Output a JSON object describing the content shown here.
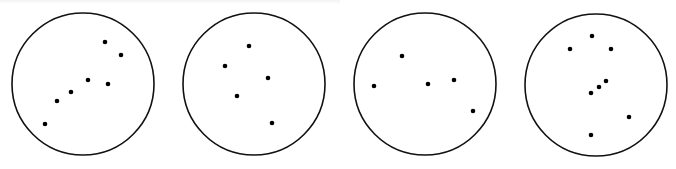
{
  "diagram": {
    "type": "dot-pattern-panels",
    "stroke_color": "#111111",
    "dot_color": "#000000",
    "panels": [
      {
        "id": "panel-1",
        "circle": {
          "cx": 83,
          "cy": 84,
          "r": 71
        },
        "dots": [
          [
            105,
            42
          ],
          [
            121,
            55
          ],
          [
            88,
            80
          ],
          [
            108,
            84
          ],
          [
            71,
            92
          ],
          [
            57,
            101
          ],
          [
            45,
            124
          ]
        ]
      },
      {
        "id": "panel-2",
        "circle": {
          "cx": 254,
          "cy": 84,
          "r": 71
        },
        "dots": [
          [
            249,
            46
          ],
          [
            225,
            66
          ],
          [
            268,
            78
          ],
          [
            237,
            96
          ],
          [
            272,
            123
          ]
        ]
      },
      {
        "id": "panel-3",
        "circle": {
          "cx": 425,
          "cy": 84,
          "r": 71
        },
        "dots": [
          [
            402,
            56
          ],
          [
            374,
            86
          ],
          [
            428,
            84
          ],
          [
            454,
            80
          ],
          [
            473,
            111
          ]
        ]
      },
      {
        "id": "panel-4",
        "circle": {
          "cx": 596,
          "cy": 85,
          "r": 71
        },
        "dots": [
          [
            592,
            36
          ],
          [
            570,
            49
          ],
          [
            611,
            49
          ],
          [
            606,
            81
          ],
          [
            599,
            87
          ],
          [
            591,
            93
          ],
          [
            629,
            117
          ],
          [
            591,
            135
          ]
        ]
      }
    ]
  }
}
